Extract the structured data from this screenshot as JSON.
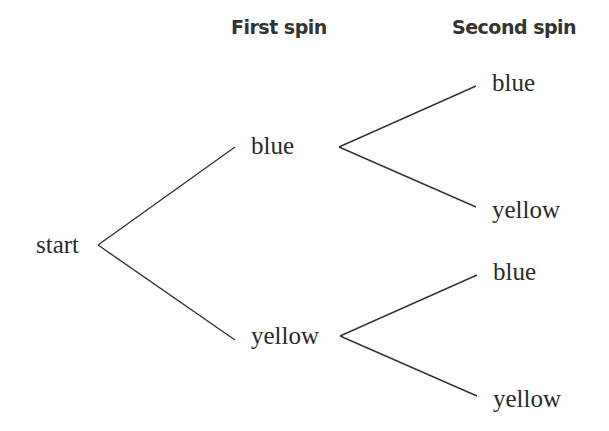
{
  "headers": {
    "first_spin": "First spin",
    "second_spin": "Second spin"
  },
  "nodes": {
    "root": "start",
    "first": [
      {
        "label": "blue",
        "children": [
          "blue",
          "yellow"
        ]
      },
      {
        "label": "yellow",
        "children": [
          "blue",
          "yellow"
        ]
      }
    ]
  },
  "colors": {
    "line": "#333333",
    "text": "#2a2a2a",
    "background": "#ffffff"
  }
}
